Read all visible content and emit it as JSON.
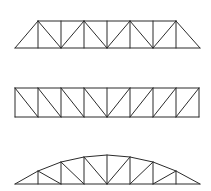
{
  "diagram": {
    "title": "",
    "stroke_color": "#2b2b2b",
    "background": "#ffffff",
    "trusses": [
      {
        "name": "triangular-end-truss",
        "bottom_chord": {
          "y": 48,
          "x1": 15,
          "x2": 200
        },
        "top_chord": {
          "y": 21,
          "x1": 38,
          "x2": 176
        },
        "verticals_x": [
          38,
          61,
          84,
          107,
          130,
          153,
          176
        ],
        "top_nodes_x": [
          38,
          84,
          130,
          176
        ],
        "bottom_v_nodes_x": [
          61,
          107,
          153
        ]
      },
      {
        "name": "rectangular-pratt-truss",
        "top_y": 88,
        "bottom_y": 117,
        "panel_x": [
          15,
          38,
          61,
          84,
          107,
          130,
          153,
          176,
          199
        ],
        "center_x": 107
      },
      {
        "name": "bowstring-arch-truss",
        "bottom_y": 184,
        "x1": 15,
        "x2": 200,
        "peak": {
          "x": 107,
          "y": 155
        },
        "verticals": [
          {
            "x": 38,
            "top_y": 171
          },
          {
            "x": 61,
            "top_y": 162
          },
          {
            "x": 84,
            "top_y": 157
          },
          {
            "x": 107,
            "top_y": 155
          },
          {
            "x": 130,
            "top_y": 157
          },
          {
            "x": 153,
            "top_y": 162
          },
          {
            "x": 176,
            "top_y": 171
          }
        ]
      }
    ]
  }
}
